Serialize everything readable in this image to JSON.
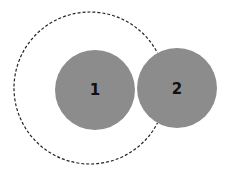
{
  "diagram": {
    "circles": [
      {
        "id": "1",
        "label": "1",
        "cx": 95,
        "cy": 90,
        "r": 40
      },
      {
        "id": "2",
        "label": "2",
        "cx": 177,
        "cy": 88,
        "r": 40
      }
    ],
    "dashed_boundary": {
      "cx": 90,
      "cy": 88,
      "r": 76
    },
    "colors": {
      "circle_fill": "#8c8c8c",
      "dash_stroke": "#222222",
      "label": "#111111"
    }
  }
}
